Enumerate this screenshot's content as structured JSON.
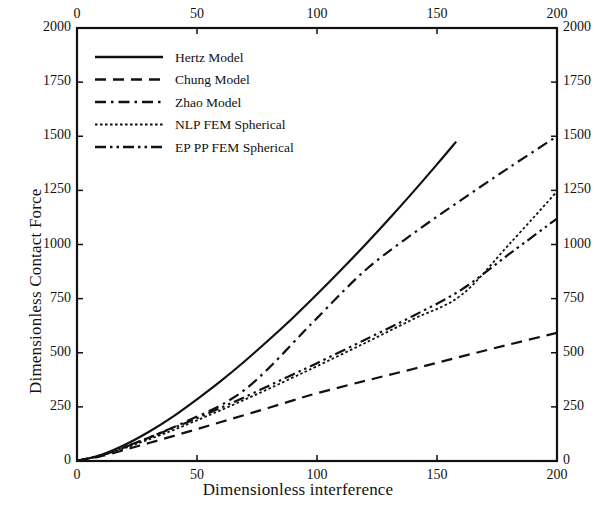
{
  "chart_data": {
    "type": "line",
    "title": "",
    "xlabel": "Dimensionless interference",
    "ylabel": "Dimensionless Contact Force",
    "xlim": [
      0,
      200
    ],
    "ylim": [
      0,
      2000
    ],
    "xticks": [
      0,
      50,
      100,
      150,
      200
    ],
    "yticks": [
      0,
      250,
      500,
      750,
      1000,
      1250,
      1500,
      1750,
      2000
    ],
    "xtick_labels": [
      "0",
      "50",
      "100",
      "150",
      "200"
    ],
    "ytick_labels": [
      "0",
      "250",
      "500",
      "750",
      "1000",
      "1250",
      "1500",
      "1750",
      "2000"
    ],
    "grid": false,
    "legend_position": "upper left",
    "mirrored_axes": true,
    "frame": "box",
    "series": [
      {
        "name": "Hertz Model",
        "style": "solid",
        "color": "#111111",
        "x": [
          0,
          10,
          20,
          30,
          40,
          50,
          60,
          70,
          80,
          90,
          100,
          110,
          120,
          130,
          140,
          150,
          158
        ],
        "y": [
          0,
          28,
          75,
          135,
          205,
          285,
          370,
          462,
          560,
          662,
          770,
          882,
          998,
          1118,
          1242,
          1370,
          1475
        ]
      },
      {
        "name": "Chung Model",
        "style": "dashed",
        "color": "#111111",
        "x": [
          0,
          10,
          20,
          30,
          40,
          50,
          60,
          70,
          80,
          90,
          100,
          120,
          140,
          160,
          180,
          200
        ],
        "y": [
          0,
          22,
          52,
          83,
          115,
          147,
          180,
          213,
          246,
          280,
          313,
          370,
          425,
          482,
          538,
          592
        ]
      },
      {
        "name": "Zhao Model",
        "style": "dashdot",
        "color": "#111111",
        "x": [
          0,
          10,
          20,
          30,
          40,
          50,
          60,
          70,
          80,
          90,
          100,
          120,
          140,
          160,
          180,
          200
        ],
        "y": [
          0,
          26,
          64,
          108,
          155,
          205,
          258,
          330,
          430,
          545,
          660,
          880,
          1050,
          1205,
          1355,
          1500
        ]
      },
      {
        "name": "NLP FEM Spherical",
        "style": "dotted",
        "color": "#111111",
        "x": [
          0,
          10,
          20,
          30,
          40,
          50,
          60,
          70,
          80,
          90,
          100,
          120,
          140,
          160,
          180,
          200
        ],
        "y": [
          0,
          25,
          60,
          100,
          142,
          188,
          235,
          284,
          334,
          386,
          438,
          545,
          655,
          765,
          1000,
          1245
        ]
      },
      {
        "name": "EP PP FEM Spherical",
        "style": "dashdotdot",
        "color": "#111111",
        "x": [
          0,
          10,
          20,
          30,
          40,
          50,
          60,
          70,
          80,
          90,
          100,
          120,
          140,
          160,
          180,
          200
        ],
        "y": [
          0,
          27,
          66,
          108,
          152,
          198,
          246,
          296,
          348,
          400,
          452,
          560,
          670,
          790,
          955,
          1120
        ]
      }
    ]
  },
  "legend": {
    "entries": [
      {
        "label": "Hertz Model"
      },
      {
        "label": "Chung Model"
      },
      {
        "label": "Zhao Model"
      },
      {
        "label": "NLP FEM Spherical"
      },
      {
        "label": "EP PP FEM Spherical"
      }
    ]
  }
}
